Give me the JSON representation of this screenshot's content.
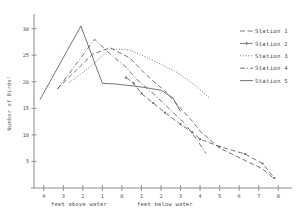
{
  "chart_data": {
    "type": "line",
    "title": "",
    "xlabel_left": "feet above water",
    "xlabel_right": "feet below water",
    "ylabel": "Number of Birds¹",
    "grid": false,
    "legend_position": "right",
    "xlim": [
      4.5,
      -8.5
    ],
    "ylim": [
      0,
      32
    ],
    "x_ticks": [
      4,
      3,
      2,
      1,
      0,
      -1,
      -2,
      -3,
      -4,
      -5,
      -6,
      -7,
      -8
    ],
    "x_tick_labels": [
      "4",
      "3",
      "2",
      "1",
      "0",
      "1",
      "2",
      "3",
      "4",
      "5",
      "6",
      "7",
      "8"
    ],
    "y_ticks": [
      5,
      10,
      15,
      20,
      25,
      30
    ],
    "y_tick_labels": [
      "5",
      "10",
      "15",
      "20",
      "25",
      "30"
    ],
    "series": [
      {
        "name": "Station 1",
        "style": "dashed",
        "x": [
          3.3,
          1.5,
          0.6,
          -0.4,
          -1.0,
          -1.6,
          -2.2,
          -3.0,
          -3.6,
          -4.0,
          -5.0,
          -6.3,
          -7.2,
          -7.8
        ],
        "values": [
          18.7,
          25.2,
          26.4,
          24.5,
          22.2,
          20.1,
          18.3,
          15.0,
          12.6,
          10.7,
          7.5,
          5.2,
          3.6,
          1.7
        ]
      },
      {
        "name": "Station 2",
        "style": "dashed-marker",
        "x": [
          -0.2,
          -0.6,
          -1.0,
          -1.6,
          -2.2,
          -3.0,
          -3.6,
          -4.0,
          -5.0,
          -6.3,
          -7.2,
          -7.8
        ],
        "values": [
          20.8,
          19.7,
          17.8,
          16.0,
          14.2,
          12.0,
          10.5,
          9.2,
          7.8,
          6.4,
          4.6,
          1.9
        ]
      },
      {
        "name": "Station 3",
        "style": "dotted",
        "x": [
          2.7,
          1.5,
          0.6,
          -0.4,
          -1.6,
          -2.8,
          -3.8,
          -4.5
        ],
        "values": [
          19.8,
          23.2,
          26.2,
          26.0,
          24.0,
          21.8,
          19.2,
          16.9
        ]
      },
      {
        "name": "Station 4",
        "style": "dash-dot",
        "x": [
          3.3,
          1.8,
          1.4,
          0.6,
          -0.2,
          -0.8,
          -1.6,
          -2.4,
          -3.2,
          -3.8,
          -4.3
        ],
        "values": [
          18.6,
          26.0,
          28.0,
          25.2,
          22.8,
          20.3,
          17.8,
          15.0,
          12.2,
          9.3,
          6.5
        ]
      },
      {
        "name": "Station 5",
        "style": "solid",
        "x": [
          4.2,
          2.1,
          1.0,
          0.4,
          -0.1,
          -0.6,
          -1.2,
          -2.0,
          -2.6,
          -3.0
        ],
        "values": [
          16.6,
          30.5,
          19.7,
          19.6,
          19.4,
          19.2,
          18.9,
          18.4,
          17.0,
          14.4
        ]
      }
    ]
  },
  "legend": {
    "items": [
      {
        "label": "Station 1",
        "style": "dashed"
      },
      {
        "label": "Station 2",
        "style": "dashed-marker"
      },
      {
        "label": "Station 3",
        "style": "dotted"
      },
      {
        "label": "Station 4",
        "style": "dash-dot"
      },
      {
        "label": "Station 5",
        "style": "solid"
      }
    ]
  }
}
